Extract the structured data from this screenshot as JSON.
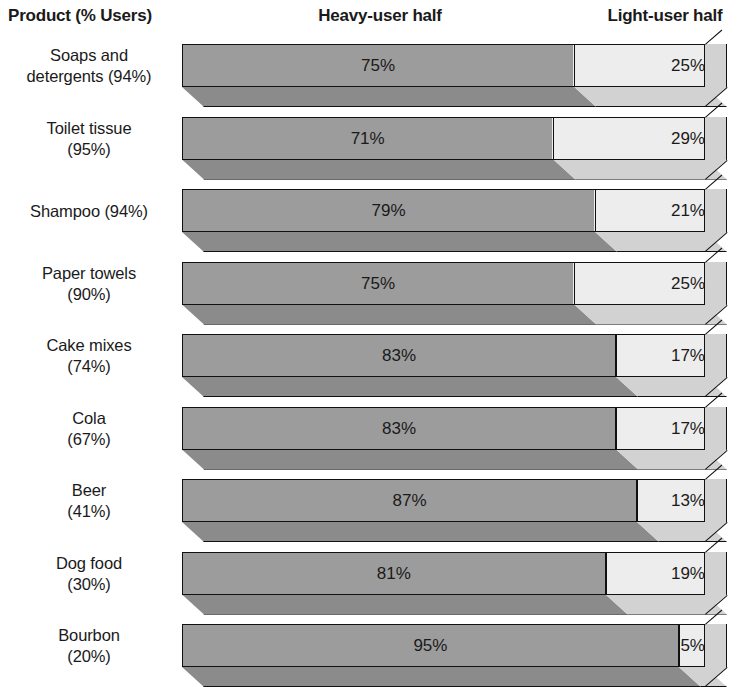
{
  "header": {
    "product_label": "Product (% Users)",
    "heavy_label": "Heavy-user half",
    "light_label": "Light-user half"
  },
  "colors": {
    "dark_fill": "#9c9c9c",
    "light_fill": "#ededed",
    "dark_shadow": "#8b8b8b",
    "light_shadow": "#d2d2d2",
    "outline": "#111111",
    "text": "#1a1a1a",
    "background": "#ffffff"
  },
  "chart_data": {
    "type": "bar",
    "title": "",
    "subtitle": "",
    "xlabel": "",
    "ylabel": "",
    "orientation": "horizontal",
    "stacked": true,
    "grid": false,
    "legend_position": "top",
    "xlim": [
      0,
      100
    ],
    "categories": [
      "Soaps and detergents (94%)",
      "Toilet tissue (95%)",
      "Shampoo (94%)",
      "Paper towels (90%)",
      "Cake mixes (74%)",
      "Cola (67%)",
      "Beer (41%)",
      "Dog food (30%)",
      "Bourbon (20%)"
    ],
    "series": [
      {
        "name": "Heavy-user half",
        "values": [
          75,
          71,
          79,
          75,
          83,
          83,
          87,
          81,
          95
        ]
      },
      {
        "name": "Light-user half",
        "values": [
          25,
          29,
          21,
          25,
          17,
          17,
          13,
          19,
          5
        ]
      }
    ]
  },
  "rows": [
    {
      "label_lines": [
        "Soaps and",
        "detergents (94%)"
      ],
      "product": "Soaps and detergents",
      "users_pct": "94%",
      "heavy": 75,
      "light": 25,
      "heavy_label": "75%",
      "light_label": "25%"
    },
    {
      "label_lines": [
        "Toilet tissue",
        "(95%)"
      ],
      "product": "Toilet tissue",
      "users_pct": "95%",
      "heavy": 71,
      "light": 29,
      "heavy_label": "71%",
      "light_label": "29%"
    },
    {
      "label_lines": [
        "Shampoo (94%)"
      ],
      "product": "Shampoo",
      "users_pct": "94%",
      "heavy": 79,
      "light": 21,
      "heavy_label": "79%",
      "light_label": "21%"
    },
    {
      "label_lines": [
        "Paper towels",
        "(90%)"
      ],
      "product": "Paper towels",
      "users_pct": "90%",
      "heavy": 75,
      "light": 25,
      "heavy_label": "75%",
      "light_label": "25%"
    },
    {
      "label_lines": [
        "Cake mixes",
        "(74%)"
      ],
      "product": "Cake mixes",
      "users_pct": "74%",
      "heavy": 83,
      "light": 17,
      "heavy_label": "83%",
      "light_label": "17%"
    },
    {
      "label_lines": [
        "Cola",
        "(67%)"
      ],
      "product": "Cola",
      "users_pct": "67%",
      "heavy": 83,
      "light": 17,
      "heavy_label": "83%",
      "light_label": "17%"
    },
    {
      "label_lines": [
        "Beer",
        "(41%)"
      ],
      "product": "Beer",
      "users_pct": "41%",
      "heavy": 87,
      "light": 13,
      "heavy_label": "87%",
      "light_label": "13%"
    },
    {
      "label_lines": [
        "Dog food",
        "(30%)"
      ],
      "product": "Dog food",
      "users_pct": "30%",
      "heavy": 81,
      "light": 19,
      "heavy_label": "81%",
      "light_label": "19%"
    },
    {
      "label_lines": [
        "Bourbon",
        "(20%)"
      ],
      "product": "Bourbon",
      "users_pct": "20%",
      "heavy": 95,
      "light": 5,
      "heavy_label": "95%",
      "light_label": "5%"
    }
  ]
}
